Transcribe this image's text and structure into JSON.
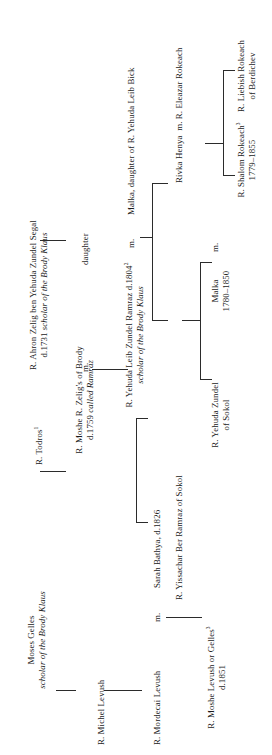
{
  "chart": {
    "orientation": "rotated-90-ccw",
    "text_color": "#1a1a1a",
    "line_color": "#2b2b2b",
    "background": "#ffffff"
  },
  "people": {
    "moses_gelles": {
      "name": "Moses Gelles",
      "note": "scholar of the Brody Klaus"
    },
    "michel_levush": {
      "name": "R. Michel Levush"
    },
    "mordecai_levush": {
      "name": "R. Mordecai Levush"
    },
    "moshe_levush_or_gelles": {
      "name": "R. Moshe Levush or Gelles",
      "ref": "3",
      "dates": "d.1851"
    },
    "todros": {
      "name": "R. Todros",
      "ref": "1"
    },
    "moshe_r_zeligs": {
      "name": "R. Moshe R. Zelig's of Brody",
      "note": "d.1759 called Ramraz"
    },
    "ahron_zelig": {
      "name": "R. Ahron Zelig ben Yehuda Zundel Segal",
      "dates": "d.1731",
      "note": "scholar of the Brody Klaus"
    },
    "daughter": {
      "name": "daughter"
    },
    "sarah_bathya": {
      "name": "Sarah Bathya, d.1826"
    },
    "yehuda_leib_zundel": {
      "name": "R. Yehuda Leib Zundel Ramraz d.1804",
      "ref": "2",
      "note": "scholar of the Brody Klaus"
    },
    "malka_bick": {
      "name": "Malka, daughter of R. Yehuda Leib Bick"
    },
    "yissachar_ber": {
      "name": "R. Yissachar Ber Ramraz of Sokol"
    },
    "yehuda_zundel_sokol": {
      "name": "R. Yehuda Zundel",
      "note": "of Sokol"
    },
    "malka": {
      "name": "Malka",
      "dates": "1780–1850"
    },
    "rivka_henya": {
      "name": "Rivka Henya"
    },
    "eleazar_rokeach": {
      "name": "R. Eleazar Rokeach"
    },
    "shalom_rokeach": {
      "name": "R. Shalom Rokeach",
      "ref": "3",
      "dates": "1779–1855"
    },
    "liebish_rokeach": {
      "name": "R. Liebish Rokeach",
      "note": "of Berdichev"
    }
  },
  "markers": {
    "marriage_1": "m.",
    "marriage_2": "m.",
    "marriage_3": "m.",
    "marriage_4": "m.",
    "marriage_5": "m."
  }
}
